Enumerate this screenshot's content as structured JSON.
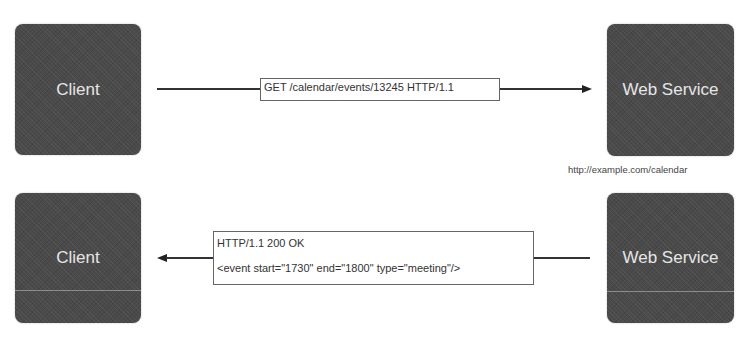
{
  "colors": {
    "node_fill": "#4a4a4a",
    "node_text": "#e6e6e6",
    "connector": "#333333",
    "label_border": "#666666"
  },
  "request": {
    "client": {
      "label": "Client"
    },
    "service": {
      "label": "Web Service",
      "url": "http://example.com/calendar"
    },
    "message": {
      "line1": "GET /calendar/events/13245 HTTP/1.1"
    },
    "direction": "client-to-service"
  },
  "response": {
    "client": {
      "label": "Client"
    },
    "service": {
      "label": "Web Service"
    },
    "message": {
      "line1": "HTTP/1.1 200 OK",
      "line2": "<event start=\"1730\" end=\"1800\" type=\"meeting\"/>"
    },
    "direction": "service-to-client"
  }
}
